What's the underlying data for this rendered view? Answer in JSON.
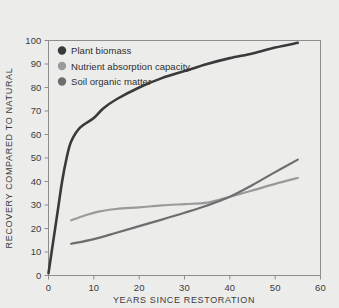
{
  "chart_data": {
    "type": "line",
    "title": "",
    "xlabel": "YEARS SINCE RESTORATION",
    "ylabel": "RECOVERY COMPARED TO NATURAL",
    "xlim": [
      0,
      60
    ],
    "ylim": [
      0,
      100
    ],
    "xticks": [
      0,
      10,
      20,
      30,
      40,
      50,
      60
    ],
    "yticks": [
      0,
      10,
      20,
      30,
      40,
      50,
      60,
      70,
      80,
      90,
      100
    ],
    "grid": false,
    "legend_position": "upper-left",
    "series": [
      {
        "name": "Plant biomass",
        "color": "#3a3a3a",
        "x": [
          0,
          1,
          2,
          3,
          4,
          5,
          7,
          10,
          12,
          15,
          20,
          25,
          30,
          35,
          40,
          45,
          50,
          55
        ],
        "y": [
          1,
          14,
          27,
          40,
          50,
          57,
          63,
          67,
          71,
          75,
          80,
          84,
          87,
          90,
          92.5,
          94.5,
          97,
          99
        ]
      },
      {
        "name": "Nutrient absorption capacity",
        "color": "#9a9a9a",
        "x": [
          5,
          8,
          11,
          15,
          20,
          25,
          30,
          35,
          40,
          45,
          50,
          55
        ],
        "y": [
          23.5,
          25.5,
          27.2,
          28.3,
          29.0,
          29.8,
          30.4,
          31.0,
          33.5,
          36.2,
          39.0,
          41.5
        ]
      },
      {
        "name": "Soil organic matter",
        "color": "#6d6d6d",
        "x": [
          5,
          10,
          15,
          20,
          25,
          30,
          35,
          40,
          45,
          50,
          55
        ],
        "y": [
          13.5,
          15.5,
          18.2,
          21.0,
          23.8,
          26.7,
          29.8,
          33.5,
          38.5,
          44.0,
          49.3
        ]
      }
    ]
  },
  "axes": {
    "x_tick_labels": [
      "0",
      "10",
      "20",
      "30",
      "40",
      "50",
      "60"
    ],
    "y_tick_labels": [
      "0",
      "10",
      "20",
      "30",
      "40",
      "50",
      "60",
      "70",
      "80",
      "90",
      "100"
    ],
    "x_axis_title": "YEARS SINCE RESTORATION",
    "y_axis_title": "RECOVERY COMPARED TO NATURAL"
  },
  "legend": {
    "items": [
      {
        "label": "Plant biomass",
        "color": "#3a3a3a"
      },
      {
        "label": "Nutrient absorption capacity",
        "color": "#9a9a9a"
      },
      {
        "label": "Soil organic matter",
        "color": "#6d6d6d"
      }
    ]
  },
  "colors": {
    "background": "#ececeb",
    "axis": "#8d8d8d",
    "text": "#3b3b3b"
  }
}
